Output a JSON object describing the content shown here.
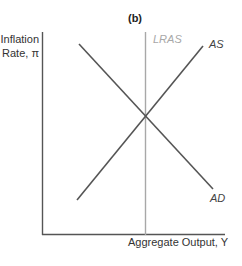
{
  "diagram": {
    "title": "(b)",
    "y_axis_label_line1": "Inflation",
    "y_axis_label_line2": "Rate, π",
    "x_axis_label": "Aggregate Output, Y",
    "curves": {
      "lras": {
        "label": "LRAS",
        "color": "#a8a8a8"
      },
      "as": {
        "label": "AS",
        "color": "#555555"
      },
      "ad": {
        "label": "AD",
        "color": "#555555"
      }
    },
    "axis_color": "#555555"
  }
}
